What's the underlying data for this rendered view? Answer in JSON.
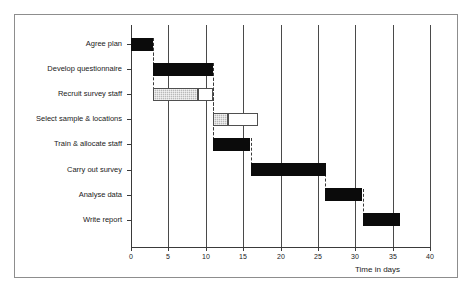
{
  "chart_data": {
    "type": "bar",
    "chart_kind": "gantt",
    "title": "",
    "xlabel": "Time in days",
    "ylabel": "",
    "xlim": [
      0,
      40
    ],
    "xticks": [
      0,
      5,
      10,
      15,
      20,
      25,
      30,
      35,
      40
    ],
    "xtick_labels": [
      "0",
      "5",
      "10",
      "15",
      "20",
      "25",
      "30",
      "35",
      "40"
    ],
    "grid": "vertical",
    "legend": "none",
    "categories": [
      "Agree plan",
      "Develop questionnaire",
      "Recruit survey staff",
      "Select sample & locations",
      "Train & allocate staff",
      "Carry out survey",
      "Analyse data",
      "Write report"
    ],
    "tasks": [
      {
        "name": "Agree plan",
        "start": 0,
        "end": 3,
        "duration": 3,
        "float_end": 3,
        "float": 0,
        "style": "critical"
      },
      {
        "name": "Develop questionnaire",
        "start": 3,
        "end": 11,
        "duration": 8,
        "float_end": 11,
        "float": 0,
        "style": "critical"
      },
      {
        "name": "Recruit survey staff",
        "start": 3,
        "end": 9,
        "duration": 6,
        "float_end": 11,
        "float": 2,
        "style": "activity-with-float"
      },
      {
        "name": "Select sample & locations",
        "start": 11,
        "end": 13,
        "duration": 2,
        "float_end": 17,
        "float": 4,
        "style": "activity-with-float"
      },
      {
        "name": "Train & allocate staff",
        "start": 11,
        "end": 16,
        "duration": 5,
        "float_end": 16,
        "float": 0,
        "style": "critical"
      },
      {
        "name": "Carry out survey",
        "start": 16,
        "end": 26,
        "duration": 10,
        "float_end": 26,
        "float": 0,
        "style": "critical"
      },
      {
        "name": "Analyse data",
        "start": 26,
        "end": 31,
        "duration": 5,
        "float_end": 31,
        "float": 0,
        "style": "critical"
      },
      {
        "name": "Write report",
        "start": 31,
        "end": 36,
        "duration": 5,
        "float_end": 36,
        "float": 0,
        "style": "critical"
      }
    ],
    "dependencies": [
      {
        "from": "Agree plan",
        "to": "Develop questionnaire",
        "day": 3
      },
      {
        "from": "Agree plan",
        "to": "Recruit survey staff",
        "day": 3
      },
      {
        "from": "Develop questionnaire",
        "to": "Select sample & locations",
        "day": 11
      },
      {
        "from": "Develop questionnaire",
        "to": "Train & allocate staff",
        "day": 11
      },
      {
        "from": "Recruit survey staff",
        "to": "Train & allocate staff",
        "day": 11
      },
      {
        "from": "Train & allocate staff",
        "to": "Carry out survey",
        "day": 16
      },
      {
        "from": "Carry out survey",
        "to": "Analyse data",
        "day": 26
      },
      {
        "from": "Analyse data",
        "to": "Write report",
        "day": 31
      }
    ],
    "colors": {
      "critical_bar": "#0b0b0b",
      "activity_bar": "#b9b9b9",
      "float_bar": "#ffffff",
      "bar_outline": "#4f4f4f",
      "gridline": "#4a4a4a",
      "axis": "#3a3a3a",
      "text": "#1a1a1a",
      "frame": "#8d8d8d",
      "background": "#ffffff"
    }
  }
}
